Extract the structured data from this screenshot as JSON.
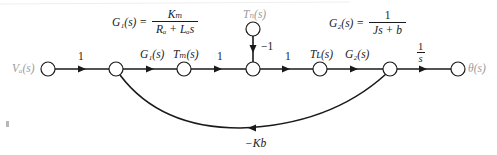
{
  "figure": {
    "type": "signal-flow-graph",
    "colors": {
      "line": "#1a1a1a",
      "io_label": "#9a9a9a",
      "node_fill": "#ffffff"
    }
  },
  "formulas": {
    "g1": {
      "lhs": "G₁(s) =",
      "num": "Kₘ",
      "den": "Rₐ + Lₐs"
    },
    "g2": {
      "lhs": "G₂(s) =",
      "num": "1",
      "den": "Js + b"
    }
  },
  "nodes": {
    "input": "Vₐ(s)",
    "torque_motor": "Tₘ(s)",
    "disturbance": "Tₙ(s)",
    "torque_load": "Tʟ(s)",
    "output": "θ(s)"
  },
  "node_labels": {
    "input": "Va(s)",
    "torque_motor": "Tm(s)",
    "disturbance": "Td(s)",
    "torque_load": "TL(s)",
    "output": "θ(s)"
  },
  "branches": {
    "b1": "1",
    "b2": "G₁(s)",
    "b3": "1",
    "b4": "1",
    "b5": "G₂(s)",
    "b6_num": "1",
    "b6_den": "s",
    "disturbance_gain": "−1",
    "feedback": "−K_b"
  },
  "branch_labels": {
    "b1": "1",
    "b2": "G1(s)",
    "b3": "1",
    "b4": "1",
    "b5": "G2(s)",
    "b6_num": "1",
    "b6_den": "s",
    "disturbance_gain": "−1",
    "feedback": "−Kb"
  }
}
